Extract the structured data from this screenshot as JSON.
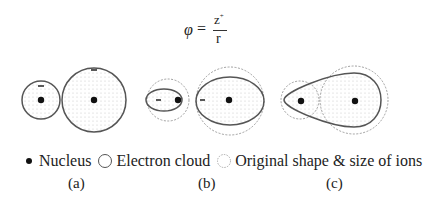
{
  "formula": {
    "lhs": "φ",
    "equals": "=",
    "numerator": "z",
    "numerator_sup": "+",
    "denominator": "r"
  },
  "panels": [
    {
      "label": "(a)",
      "description": "Small cation and large anion, both circular, unpolarized"
    },
    {
      "label": "(b)",
      "description": "Both ions distorted into ellipses, dashed original shapes"
    },
    {
      "label": "(c)",
      "description": "Anion electron cloud pulled toward cation forming teardrop"
    }
  ],
  "legend": [
    {
      "icon": "filled-dot-icon",
      "label": "Nucleus"
    },
    {
      "icon": "solid-circle-icon",
      "label": "Electron cloud"
    },
    {
      "icon": "dashed-circle-icon",
      "label": "Original shape & size of ions"
    }
  ],
  "charge_symbol": "−",
  "colors": {
    "outline": "#555555",
    "dashed": "#888888",
    "nucleus": "#111111",
    "fill_dots": "#bbbbbb"
  }
}
